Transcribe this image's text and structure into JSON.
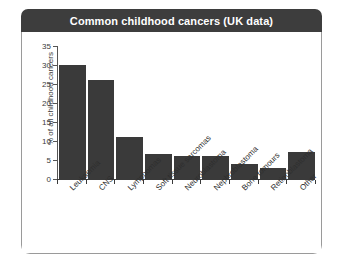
{
  "figure": {
    "title": "Common childhood cancers (UK data)",
    "title_bar_color": "#3d3d3d",
    "title_text_color": "#ffffff",
    "frame_border_color": "#9a9a9a",
    "background_color": "#ffffff"
  },
  "chart_data": {
    "type": "bar",
    "title": "Common childhood cancers (UK data)",
    "xlabel": "",
    "ylabel": "% of all childhood cancers",
    "categories": [
      "Leukaemia",
      "CNS",
      "Lymphomas",
      "Soft tissue sarcomas",
      "Neuroblastoma",
      "Nephroblastoma",
      "Bone tomours",
      "Retinoblastoma",
      "Other"
    ],
    "values": [
      30,
      26,
      11,
      6.5,
      6,
      6,
      4,
      3,
      7.2
    ],
    "ylim": [
      0,
      35
    ],
    "ytick_labels": [
      "0",
      "5",
      "10",
      "15",
      "20",
      "25",
      "30",
      "35"
    ],
    "ytick_values": [
      0,
      5,
      10,
      15,
      20,
      25,
      30,
      35
    ],
    "grid": false,
    "legend": false,
    "bar_color": "#3a3a3a",
    "axis_color": "#3a3a3a"
  }
}
